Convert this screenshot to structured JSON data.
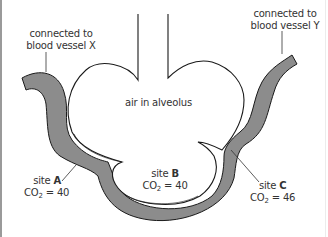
{
  "diagram": {
    "colors": {
      "capillary_fill": "#8c8c8c",
      "outline": "#1a1a1a",
      "text": "#333333",
      "background": "#ffffff"
    },
    "labels": {
      "vessel_x_line1": "connected to",
      "vessel_x_line2": "blood vessel X",
      "vessel_y_line1": "connected to",
      "vessel_y_line2": "blood vessel Y",
      "alveolus": "air in alveolus"
    },
    "sites": [
      {
        "prefix": "site",
        "id": "A",
        "co2_label": "CO",
        "co2_sub": "2",
        "co2_value": "= 40"
      },
      {
        "prefix": "site",
        "id": "B",
        "co2_label": "CO",
        "co2_sub": "2",
        "co2_value": "= 40"
      },
      {
        "prefix": "site",
        "id": "C",
        "co2_label": "CO",
        "co2_sub": "2",
        "co2_value": "= 46"
      }
    ]
  }
}
